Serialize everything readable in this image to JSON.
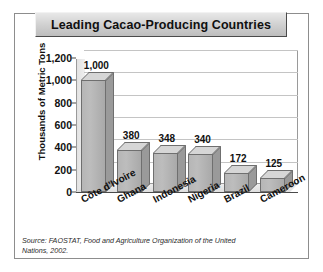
{
  "figure": {
    "title": "Leading Cacao-Producing Countries",
    "source_note": "Source: FAOSTAT, Food and Agriculture Organization of the United Nations, 2002."
  },
  "chart_data": {
    "type": "bar",
    "title": "Leading Cacao-Producing Countries",
    "xlabel": "",
    "ylabel": "Thousands of Metric Tons",
    "categories": [
      "Côte d'Ivoire",
      "Ghana",
      "Indonesia",
      "Nigeria",
      "Brazil",
      "Cameroon"
    ],
    "values": [
      1000,
      380,
      348,
      340,
      172,
      125
    ],
    "value_labels": [
      "1,000",
      "380",
      "348",
      "340",
      "172",
      "125"
    ],
    "ylim": [
      0,
      1200
    ],
    "yticks": [
      0,
      200,
      400,
      600,
      800,
      1000,
      1200
    ],
    "ytick_labels": [
      "0",
      "200",
      "400",
      "600",
      "800",
      "1,000",
      "1,200"
    ],
    "grid": true,
    "legend": "none",
    "style": "3d-column",
    "bar_color": "#b6b6b6",
    "bar_top_color": "#d6d6d6",
    "bar_side_color": "#9a9a9a",
    "grid_color": "#c4c4c4",
    "axis_color": "#4a4a4a"
  }
}
